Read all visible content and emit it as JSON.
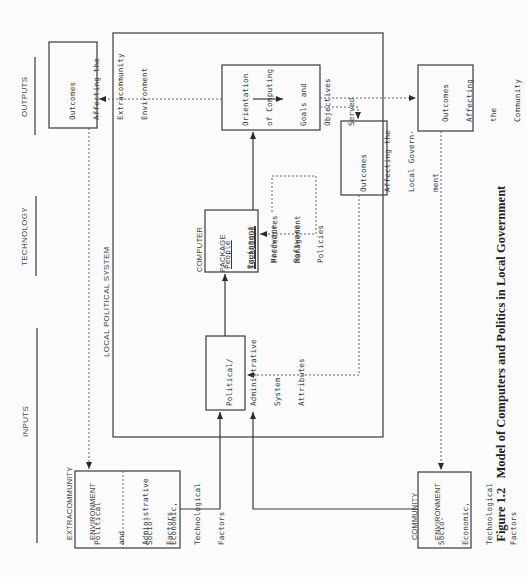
{
  "figure": {
    "number": "Figure 1.2",
    "title": "Model of Computers and Politics in Local Government"
  },
  "columns": {
    "outputs": "OUTPUTS",
    "technology": "TECHNOLOGY",
    "inputs": "INPUTS"
  },
  "system_label": "LOCAL POLITICAL SYSTEM",
  "computer_package": {
    "heading_line1": "COMPUTER",
    "heading_line2": "PACKAGE",
    "people": "People",
    "equipment": "Equipment",
    "hardware": "Hardware",
    "software": "Software",
    "technique": "Technique",
    "procedures": "Procedures",
    "management": "Management",
    "policies": "Policies"
  },
  "boxes": {
    "orientation": {
      "line1": "Orientation",
      "line2": "of Computing"
    },
    "goals": {
      "line1": "Goals and",
      "line2": "Objectives",
      "line3": "Served"
    },
    "political_admin": {
      "line1": "Political/",
      "line2": "Administrative",
      "line3": "System",
      "line4": "Attributes"
    },
    "local_gov_outcomes": {
      "line1": "Outcomes",
      "line2": "Affecting the",
      "line3": "Local Govern-",
      "line4": "ment"
    },
    "extracommunity_outcomes": {
      "line1": "Outcomes",
      "line2": "Affecting the",
      "line3": "Extracommunity",
      "line4": "Environment"
    },
    "community_outcomes": {
      "line1": "Outcomes",
      "line2": "Affecting",
      "line3": "the",
      "line4": "Community"
    },
    "extracommunity_env": {
      "heading_line1": "EXTRACOMMUNITY",
      "heading_line2": "ENVIRONMENT",
      "political_line1": "Political",
      "political_line2": "and",
      "political_line3": "Administrative",
      "political_line4": "Factors",
      "socio_line1": "Socio-",
      "socio_line2": "Economic,",
      "socio_line3": "Technological",
      "socio_line4": "Factors"
    },
    "community_env": {
      "heading_line1": "COMMUNITY",
      "heading_line2": "ENVIRONMENT",
      "socio_line1": "Socio-",
      "socio_line2": "Economic,",
      "socio_line3": "Technological",
      "socio_line4": "Factors"
    }
  },
  "colors": {
    "line": "#3a3a3a",
    "background": "#fbfbfb"
  }
}
